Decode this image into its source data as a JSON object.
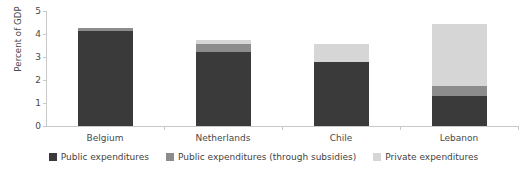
{
  "chart_data": {
    "type": "bar",
    "subtype": "stacked-bar",
    "title": "",
    "xlabel": "",
    "ylabel": "Percent of GDP",
    "ylim": [
      0,
      5
    ],
    "ytick_labels": [
      "0",
      "1",
      "2",
      "3",
      "4",
      "5"
    ],
    "ytick_values": [
      0,
      1,
      2,
      3,
      4,
      5
    ],
    "grid": false,
    "legend_position": "bottom-center",
    "categories": [
      "Belgium",
      "Netherlands",
      "Chile",
      "Lebanon"
    ],
    "series": [
      {
        "name": "Public expenditures",
        "color": "#3a3a3a",
        "values": [
          4.15,
          3.2,
          2.8,
          1.3
        ]
      },
      {
        "name": "Public expenditures (through subsidies)",
        "color": "#8c8c8c",
        "values": [
          0.1,
          0.35,
          0.0,
          0.45
        ]
      },
      {
        "name": "Private expenditures",
        "color": "#d6d6d6",
        "values": [
          0.0,
          0.2,
          0.75,
          2.7
        ]
      }
    ],
    "totals": [
      4.25,
      3.75,
      3.55,
      4.45
    ]
  },
  "axis": {
    "y_title": "Percent of GDP"
  },
  "colors": {
    "public": "#3a3a3a",
    "subsidies": "#8c8c8c",
    "private": "#d6d6d6",
    "axis_line": "#c9c9c9",
    "text": "#4a4a4a",
    "background": "#ffffff"
  }
}
